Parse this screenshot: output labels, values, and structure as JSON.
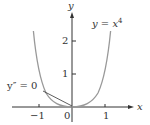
{
  "figure": {
    "function_label": "y = x⁴",
    "function_label_base": "y = x",
    "function_label_exp": "4",
    "annotation": "y″ = 0",
    "x_axis_label": "x",
    "y_axis_label": "y",
    "x_ticks": [
      "−1",
      "0",
      "1"
    ],
    "y_ticks": [
      "1",
      "2"
    ],
    "curve_color": "#999999",
    "axis_color": "#333333"
  }
}
